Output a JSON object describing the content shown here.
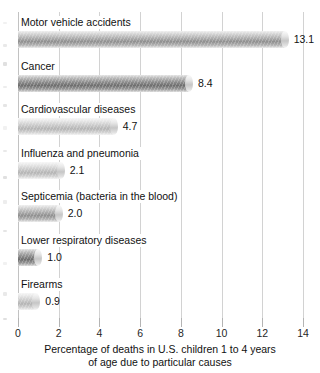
{
  "chart_data": {
    "type": "bar",
    "orientation": "horizontal",
    "title": "",
    "categories": [
      "Motor vehicle accidents",
      "Cancer",
      "Cardiovascular diseases",
      "Influenza and pneumonia",
      "Septicemia (bacteria in the blood)",
      "Lower respiratory diseases",
      "Firearms"
    ],
    "values": [
      13.1,
      8.4,
      4.7,
      2.1,
      2.0,
      1.0,
      0.9
    ],
    "value_labels": [
      "13.1",
      "8.4",
      "4.7",
      "2.1",
      "2.0",
      "1.0",
      "0.9"
    ],
    "xlabel": "Percentage of deaths in U.S. children 1 to 4 years of age due to particular causes",
    "ylabel": "",
    "xlim": [
      0,
      14
    ],
    "xticks": [
      0,
      2,
      4,
      6,
      8,
      10,
      12,
      14
    ],
    "xtick_labels": [
      "0",
      "2",
      "4",
      "6",
      "8",
      "10",
      "12",
      "14"
    ],
    "grid": "vertical",
    "legend": "none",
    "bar_tones": [
      "mid",
      "dark",
      "light",
      "light",
      "mid",
      "dark",
      "light"
    ],
    "colors": {
      "bar_light": "#c9c9c9",
      "bar_mid": "#adadad",
      "bar_dark": "#8d8d8d",
      "gridline": "#d2d2d2",
      "text": "#111111",
      "background": "#ffffff"
    }
  },
  "caption": {
    "line1": "Percentage of deaths in U.S. children 1 to 4 years",
    "line2": "of age due to particular causes"
  }
}
